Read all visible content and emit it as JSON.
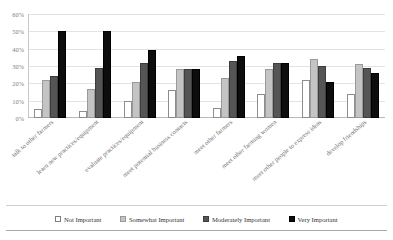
{
  "chart_data": {
    "type": "bar",
    "title": "",
    "subtitle": "",
    "xlabel": "",
    "ylabel": "",
    "ylim": [
      0,
      60
    ],
    "ytick_labels": [
      "0%",
      "10%",
      "20%",
      "30%",
      "40%",
      "50%",
      "60%"
    ],
    "ytick_values": [
      0,
      10,
      20,
      30,
      40,
      50,
      60
    ],
    "grid": true,
    "legend_position": "bottom",
    "categories": [
      "talk to other farmers",
      "learn new practices/equipment",
      "evaluate practices/equipment",
      "meet potential business contacts",
      "meet other farmers",
      "meet other farming women",
      "meet other people to express ideas",
      "develop friendships"
    ],
    "series": [
      {
        "name": "Not Important",
        "color": "#ffffff",
        "values": [
          5,
          4,
          10,
          16,
          6,
          14,
          22,
          14
        ]
      },
      {
        "name": "Somewhat Important",
        "color": "#c4c4c4",
        "values": [
          22,
          17,
          21,
          28,
          23,
          28,
          34,
          31
        ]
      },
      {
        "name": "Moderately Important",
        "color": "#555555",
        "values": [
          24,
          29,
          32,
          28,
          33,
          32,
          30,
          29
        ]
      },
      {
        "name": "Very Important",
        "color": "#0d0d0d",
        "values": [
          50,
          50,
          39,
          28,
          36,
          32,
          21,
          26
        ]
      }
    ]
  }
}
